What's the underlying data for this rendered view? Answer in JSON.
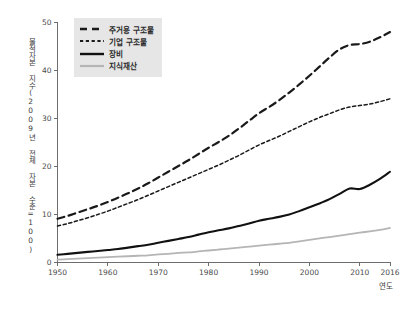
{
  "chart_data": {
    "type": "line",
    "title": "",
    "subtitle": "",
    "xlabel": "연도",
    "ylabel": "물적자본 지수(2009년 전체 자본 수준=100)",
    "xlim": [
      1950,
      2016
    ],
    "ylim": [
      0,
      50
    ],
    "grid": false,
    "legend_position": "top-left",
    "x_ticks": [
      "1950",
      "1960",
      "1970",
      "1980",
      "1990",
      "2000",
      "2010",
      "2016"
    ],
    "x_tick_values": [
      1950,
      1960,
      1970,
      1980,
      1990,
      2000,
      2010,
      2016
    ],
    "y_ticks": [
      "0",
      "10",
      "20",
      "30",
      "40",
      "50"
    ],
    "y_tick_values": [
      0,
      10,
      20,
      30,
      40,
      50
    ],
    "x": [
      1950,
      1952,
      1954,
      1956,
      1958,
      1960,
      1962,
      1964,
      1966,
      1968,
      1970,
      1972,
      1974,
      1976,
      1978,
      1980,
      1982,
      1984,
      1986,
      1988,
      1990,
      1992,
      1994,
      1996,
      1998,
      2000,
      2002,
      2004,
      2006,
      2008,
      2010,
      2012,
      2014,
      2016
    ],
    "series": [
      {
        "name": "주거용 구조물",
        "style": "long-dash",
        "color": "#1a1a1a",
        "width": 2.2,
        "values": [
          9.0,
          9.6,
          10.3,
          11.0,
          11.7,
          12.5,
          13.4,
          14.3,
          15.3,
          16.4,
          17.6,
          18.8,
          20.0,
          21.2,
          22.5,
          23.8,
          25.0,
          26.3,
          27.8,
          29.4,
          31.0,
          32.3,
          33.7,
          35.3,
          37.0,
          38.8,
          40.7,
          42.6,
          44.3,
          45.2,
          45.4,
          45.9,
          46.8,
          47.9
        ]
      },
      {
        "name": "기업 구조물",
        "style": "short-dash",
        "color": "#1a1a1a",
        "width": 1.5,
        "values": [
          7.5,
          8.0,
          8.6,
          9.2,
          9.9,
          10.6,
          11.4,
          12.2,
          13.0,
          13.9,
          14.8,
          15.7,
          16.6,
          17.5,
          18.4,
          19.3,
          20.2,
          21.2,
          22.2,
          23.3,
          24.4,
          25.3,
          26.2,
          27.2,
          28.2,
          29.2,
          30.1,
          30.9,
          31.7,
          32.3,
          32.6,
          32.9,
          33.4,
          34.0
        ]
      },
      {
        "name": "장비",
        "style": "solid",
        "color": "#111111",
        "width": 2.1,
        "values": [
          1.5,
          1.7,
          1.9,
          2.1,
          2.3,
          2.5,
          2.7,
          3.0,
          3.3,
          3.6,
          4.0,
          4.4,
          4.8,
          5.2,
          5.7,
          6.2,
          6.6,
          7.0,
          7.5,
          8.0,
          8.6,
          9.0,
          9.4,
          9.9,
          10.6,
          11.4,
          12.2,
          13.1,
          14.2,
          15.3,
          15.2,
          16.1,
          17.3,
          18.8
        ]
      },
      {
        "name": "지식재산",
        "style": "solid",
        "color": "#b5b5b5",
        "width": 1.8,
        "values": [
          0.5,
          0.6,
          0.7,
          0.8,
          0.9,
          1.0,
          1.1,
          1.2,
          1.3,
          1.4,
          1.6,
          1.7,
          1.9,
          2.0,
          2.2,
          2.4,
          2.6,
          2.8,
          3.0,
          3.2,
          3.4,
          3.6,
          3.8,
          4.0,
          4.3,
          4.6,
          4.9,
          5.2,
          5.5,
          5.8,
          6.1,
          6.4,
          6.7,
          7.1
        ]
      }
    ]
  },
  "legend": {
    "items": [
      {
        "label": "주거용 구조물",
        "swatch": "long-dash-swatch"
      },
      {
        "label": "기업 구조물",
        "swatch": "short-dash-swatch"
      },
      {
        "label": "장비",
        "swatch": "solid-black-swatch"
      },
      {
        "label": "지식재산",
        "swatch": "solid-gray-swatch"
      }
    ]
  },
  "colors": {
    "axis": "#6d6d6d",
    "text": "#3b3b3b",
    "legend_background": "#e6e6e6",
    "series_dark": "#1a1a1a",
    "series_gray": "#b5b5b5",
    "background": "#ffffff"
  }
}
